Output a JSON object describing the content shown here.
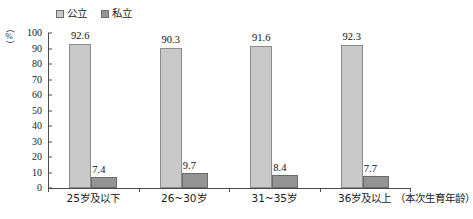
{
  "chart_data": {
    "type": "bar",
    "title": "",
    "subtitle": "",
    "xlabel": "（本次生育年龄）",
    "ylabel": "（%）",
    "ylim": [
      0,
      100
    ],
    "ytick_step": 10,
    "yticks": [
      "100",
      "90",
      "80",
      "70",
      "60",
      "50",
      "40",
      "30",
      "20",
      "10",
      "0"
    ],
    "grid": false,
    "legend_position": "top-left",
    "categories": [
      "25岁及以下",
      "26~30岁",
      "31~35岁",
      "36岁及以上"
    ],
    "series": [
      {
        "name": "公立",
        "color": "#c9c9c9",
        "values": [
          92.6,
          90.3,
          91.6,
          92.3
        ],
        "labels": [
          "92.6",
          "90.3",
          "91.6",
          "92.3"
        ]
      },
      {
        "name": "私立",
        "color": "#949494",
        "values": [
          7.4,
          9.7,
          8.4,
          7.7
        ],
        "labels": [
          "7.4",
          "9.7",
          "8.4",
          "7.7"
        ]
      }
    ]
  },
  "legend": {
    "items": [
      {
        "label": "公立",
        "color": "#c9c9c9"
      },
      {
        "label": "私立",
        "color": "#949494"
      }
    ]
  },
  "axis": {
    "unit_open_paren": "（",
    "unit_symbol": "%",
    "unit_close_paren": "）",
    "x_title": "（本次生育年龄）"
  }
}
